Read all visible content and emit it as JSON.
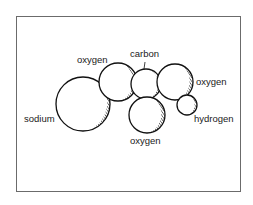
{
  "diagram": {
    "title": "",
    "atoms": [
      {
        "id": "sodium",
        "label": "sodium",
        "cx": 83,
        "cy": 104,
        "r": 27
      },
      {
        "id": "oxygen-1",
        "label": "oxygen",
        "cx": 118,
        "cy": 82,
        "r": 19
      },
      {
        "id": "carbon",
        "label": "carbon",
        "cx": 146,
        "cy": 84,
        "r": 15
      },
      {
        "id": "oxygen-2",
        "label": "oxygen",
        "cx": 175,
        "cy": 82,
        "r": 18
      },
      {
        "id": "oxygen-3",
        "label": "oxygen",
        "cx": 147,
        "cy": 115,
        "r": 18
      },
      {
        "id": "hydrogen",
        "label": "hydrogen",
        "cx": 187,
        "cy": 105,
        "r": 10
      }
    ],
    "labels": {
      "sodium": "sodium",
      "oxygen_top_left": "oxygen",
      "carbon": "carbon",
      "oxygen_right": "oxygen",
      "hydrogen": "hydrogen",
      "oxygen_bottom": "oxygen"
    },
    "colors": {
      "stroke": "#111111",
      "frame": "#6b6b6b",
      "background": "#ffffff"
    }
  }
}
